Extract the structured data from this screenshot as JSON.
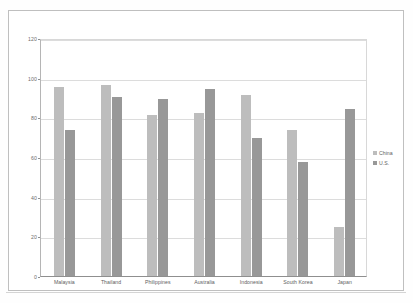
{
  "chart_data": {
    "type": "bar",
    "title": "",
    "subtitle": "",
    "xlabel": "",
    "ylabel": "",
    "ylim": [
      0,
      120
    ],
    "ytick_step": 20,
    "ytick_labels": [
      "120",
      "100",
      "80",
      "60",
      "40",
      "20",
      "0"
    ],
    "grid": true,
    "legend_position": "right",
    "categories": [
      "Malaysia",
      "Thailand",
      "Philippines",
      "Australia",
      "Indonesia",
      "South Korea",
      "Japan"
    ],
    "series": [
      {
        "name": "China",
        "color": "#bdbdbd",
        "values": [
          96,
          97,
          82,
          83,
          92,
          74,
          25
        ]
      },
      {
        "name": "U.S.",
        "color": "#989898",
        "values": [
          74,
          91,
          90,
          95,
          70,
          58,
          85
        ]
      }
    ]
  },
  "legend": {
    "items": [
      {
        "label": "China",
        "swatch": "china"
      },
      {
        "label": "U.S.",
        "swatch": "us"
      }
    ]
  },
  "colors": {
    "china": "#bdbdbd",
    "us": "#989898",
    "gridline": "#dcdcdc",
    "axis": "#8f8f8f",
    "frame": "#bfbfbf",
    "text": "#5e5e5e"
  }
}
